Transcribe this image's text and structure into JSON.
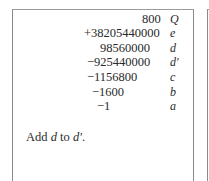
{
  "rows": [
    {
      "value": "800",
      "label": "Q"
    },
    {
      "value": "+38205440000",
      "label": "e"
    },
    {
      "value": "98560000",
      "label": "d"
    },
    {
      "value": "−925440000",
      "label": "d′"
    },
    {
      "value": "−1156800",
      "label": "c"
    },
    {
      "value": "−1600",
      "label": "b"
    },
    {
      "value": "−1",
      "label": "a"
    }
  ],
  "note": {
    "prefix": "Add ",
    "var1": "d",
    "middle": " to ",
    "var2": "d′",
    "suffix": "."
  }
}
